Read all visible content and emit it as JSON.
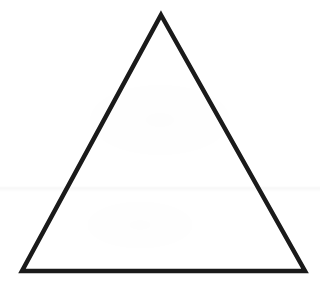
{
  "figure": {
    "name": "equilateral-triangle",
    "kind": "line-drawing",
    "background_color": "#ffffff",
    "fill_color": "#ffffff",
    "stroke_color": "#1a1a1a",
    "stroke_width": 4.5,
    "canvas": {
      "width": 320,
      "height": 287
    },
    "vertices": [
      {
        "label": "apex",
        "x": 161,
        "y": 15
      },
      {
        "label": "bottom-right",
        "x": 305,
        "y": 271
      },
      {
        "label": "bottom-left",
        "x": 22,
        "y": 271
      }
    ],
    "points_string": "161,15 305,271 22,271",
    "artifacts": {
      "faint_horizontal_line_y": 189,
      "note": "scanned-paper texture"
    }
  }
}
